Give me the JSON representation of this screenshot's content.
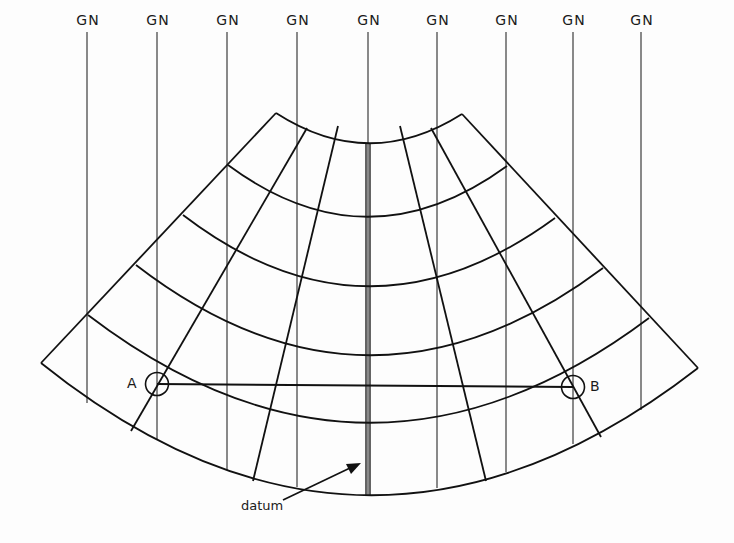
{
  "diagram": {
    "grid_north_label": "GN",
    "grid_north_lines": [
      {
        "label": "GN",
        "x": 87
      },
      {
        "label": "GN",
        "x": 157
      },
      {
        "label": "GN",
        "x": 227
      },
      {
        "label": "GN",
        "x": 297
      },
      {
        "label": "GN",
        "x": 368
      },
      {
        "label": "GN",
        "x": 437
      },
      {
        "label": "GN",
        "x": 506
      },
      {
        "label": "GN",
        "x": 573
      },
      {
        "label": "GN",
        "x": 641
      }
    ],
    "points": {
      "a": {
        "label": "A"
      },
      "b": {
        "label": "B"
      }
    },
    "datum_label": "datum",
    "parallels_count": 6,
    "meridians_count": 7,
    "line_color": "#1a1a1a"
  }
}
